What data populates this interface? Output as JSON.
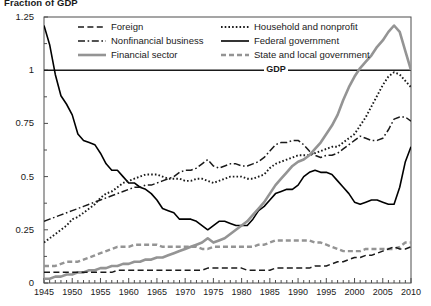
{
  "title": "Fraction of GDP",
  "axes": {
    "y_ticks": [
      "0",
      "0.25",
      "0.5",
      "0.75",
      "1",
      "1.25"
    ],
    "x_ticks": [
      "1945",
      "1950",
      "1955",
      "1960",
      "1965",
      "1970",
      "1975",
      "1980",
      "1985",
      "1990",
      "1995",
      "2000",
      "2005",
      "2010"
    ]
  },
  "gdp_line_label": "GDP",
  "legend": [
    {
      "label": "Foreign",
      "style": "dashed",
      "color": "#1a1a1a"
    },
    {
      "label": "Household and nonprofit",
      "style": "dotted",
      "color": "#1a1a1a"
    },
    {
      "label": "Nonfinancial business",
      "style": "dashdot",
      "color": "#1a1a1a"
    },
    {
      "label": "Federal government",
      "style": "solid",
      "color": "#000000"
    },
    {
      "label": "Financial sector",
      "style": "solid-gray",
      "color": "#949494"
    },
    {
      "label": "State and local government",
      "style": "dashed-gray",
      "color": "#949494"
    }
  ],
  "chart_data": {
    "type": "line",
    "title": "Fraction of GDP",
    "xlabel": "",
    "ylabel": "Fraction of GDP",
    "xlim": [
      1945,
      2010
    ],
    "ylim": [
      0,
      1.25
    ],
    "grid": false,
    "legend_position": "top-inside",
    "annotations": [
      {
        "text": "GDP",
        "y": 1.0,
        "type": "reference-line"
      }
    ],
    "x": [
      1945,
      1946,
      1947,
      1948,
      1949,
      1950,
      1951,
      1952,
      1953,
      1954,
      1955,
      1956,
      1957,
      1958,
      1959,
      1960,
      1961,
      1962,
      1963,
      1964,
      1965,
      1966,
      1967,
      1968,
      1969,
      1970,
      1971,
      1972,
      1973,
      1974,
      1975,
      1976,
      1977,
      1978,
      1979,
      1980,
      1981,
      1982,
      1983,
      1984,
      1985,
      1986,
      1987,
      1988,
      1989,
      1990,
      1991,
      1992,
      1993,
      1994,
      1995,
      1996,
      1997,
      1998,
      1999,
      2000,
      2001,
      2002,
      2003,
      2004,
      2005,
      2006,
      2007,
      2008,
      2009,
      2010
    ],
    "series": [
      {
        "name": "Federal government",
        "style": "solid",
        "color": "#000000",
        "values": [
          1.21,
          1.12,
          0.98,
          0.88,
          0.84,
          0.79,
          0.7,
          0.67,
          0.66,
          0.65,
          0.61,
          0.56,
          0.53,
          0.53,
          0.5,
          0.47,
          0.47,
          0.45,
          0.44,
          0.42,
          0.39,
          0.35,
          0.34,
          0.33,
          0.3,
          0.3,
          0.3,
          0.29,
          0.27,
          0.25,
          0.27,
          0.29,
          0.29,
          0.28,
          0.27,
          0.27,
          0.27,
          0.3,
          0.34,
          0.36,
          0.39,
          0.42,
          0.43,
          0.44,
          0.44,
          0.46,
          0.5,
          0.52,
          0.53,
          0.52,
          0.52,
          0.51,
          0.48,
          0.45,
          0.42,
          0.38,
          0.37,
          0.38,
          0.39,
          0.39,
          0.38,
          0.37,
          0.37,
          0.45,
          0.57,
          0.64
        ]
      },
      {
        "name": "Household and nonprofit",
        "style": "dotted",
        "color": "#1a1a1a",
        "values": [
          0.19,
          0.21,
          0.23,
          0.25,
          0.27,
          0.3,
          0.31,
          0.33,
          0.35,
          0.37,
          0.4,
          0.42,
          0.43,
          0.45,
          0.47,
          0.48,
          0.49,
          0.5,
          0.51,
          0.51,
          0.51,
          0.5,
          0.49,
          0.49,
          0.49,
          0.48,
          0.48,
          0.49,
          0.49,
          0.48,
          0.47,
          0.48,
          0.49,
          0.5,
          0.5,
          0.5,
          0.49,
          0.49,
          0.5,
          0.51,
          0.54,
          0.56,
          0.57,
          0.58,
          0.59,
          0.6,
          0.6,
          0.6,
          0.61,
          0.62,
          0.63,
          0.64,
          0.64,
          0.66,
          0.68,
          0.7,
          0.74,
          0.78,
          0.83,
          0.88,
          0.93,
          0.97,
          0.99,
          0.98,
          0.95,
          0.92
        ]
      },
      {
        "name": "Nonfinancial business",
        "style": "dashdot",
        "color": "#1a1a1a",
        "values": [
          0.29,
          0.3,
          0.31,
          0.32,
          0.33,
          0.34,
          0.35,
          0.36,
          0.37,
          0.38,
          0.39,
          0.4,
          0.41,
          0.42,
          0.43,
          0.44,
          0.45,
          0.45,
          0.46,
          0.46,
          0.47,
          0.48,
          0.49,
          0.5,
          0.52,
          0.53,
          0.53,
          0.54,
          0.56,
          0.58,
          0.55,
          0.54,
          0.55,
          0.56,
          0.56,
          0.55,
          0.55,
          0.56,
          0.57,
          0.59,
          0.62,
          0.65,
          0.66,
          0.66,
          0.67,
          0.67,
          0.65,
          0.62,
          0.6,
          0.59,
          0.6,
          0.6,
          0.61,
          0.63,
          0.65,
          0.67,
          0.69,
          0.68,
          0.67,
          0.67,
          0.68,
          0.72,
          0.77,
          0.78,
          0.78,
          0.76
        ]
      },
      {
        "name": "Financial sector",
        "style": "solid-gray",
        "color": "#949494",
        "values": [
          0.02,
          0.02,
          0.03,
          0.03,
          0.04,
          0.04,
          0.05,
          0.05,
          0.06,
          0.06,
          0.07,
          0.07,
          0.08,
          0.08,
          0.09,
          0.09,
          0.1,
          0.1,
          0.11,
          0.11,
          0.12,
          0.12,
          0.13,
          0.14,
          0.15,
          0.16,
          0.17,
          0.18,
          0.19,
          0.21,
          0.19,
          0.2,
          0.21,
          0.23,
          0.25,
          0.27,
          0.29,
          0.32,
          0.35,
          0.38,
          0.42,
          0.46,
          0.49,
          0.52,
          0.55,
          0.57,
          0.58,
          0.6,
          0.63,
          0.66,
          0.7,
          0.74,
          0.79,
          0.86,
          0.92,
          0.97,
          1.01,
          1.04,
          1.07,
          1.11,
          1.14,
          1.18,
          1.21,
          1.18,
          1.09,
          1.0
        ]
      },
      {
        "name": "State and local government",
        "style": "dashed-gray",
        "color": "#949494",
        "values": [
          0.08,
          0.08,
          0.08,
          0.09,
          0.1,
          0.1,
          0.1,
          0.11,
          0.12,
          0.13,
          0.14,
          0.15,
          0.16,
          0.17,
          0.17,
          0.17,
          0.18,
          0.18,
          0.18,
          0.18,
          0.18,
          0.17,
          0.17,
          0.17,
          0.17,
          0.17,
          0.17,
          0.17,
          0.16,
          0.16,
          0.17,
          0.17,
          0.17,
          0.17,
          0.17,
          0.17,
          0.17,
          0.17,
          0.18,
          0.18,
          0.19,
          0.2,
          0.2,
          0.2,
          0.2,
          0.2,
          0.2,
          0.2,
          0.19,
          0.19,
          0.18,
          0.17,
          0.16,
          0.15,
          0.15,
          0.15,
          0.15,
          0.16,
          0.16,
          0.16,
          0.16,
          0.16,
          0.16,
          0.17,
          0.19,
          0.19
        ]
      },
      {
        "name": "Foreign",
        "style": "dashed",
        "color": "#1a1a1a",
        "values": [
          0.05,
          0.05,
          0.05,
          0.05,
          0.05,
          0.05,
          0.05,
          0.05,
          0.05,
          0.05,
          0.05,
          0.05,
          0.05,
          0.06,
          0.06,
          0.06,
          0.06,
          0.06,
          0.06,
          0.06,
          0.06,
          0.06,
          0.06,
          0.06,
          0.06,
          0.06,
          0.06,
          0.06,
          0.06,
          0.07,
          0.07,
          0.07,
          0.07,
          0.07,
          0.07,
          0.07,
          0.06,
          0.06,
          0.06,
          0.06,
          0.06,
          0.07,
          0.07,
          0.07,
          0.07,
          0.07,
          0.07,
          0.07,
          0.08,
          0.08,
          0.08,
          0.09,
          0.1,
          0.1,
          0.11,
          0.12,
          0.12,
          0.13,
          0.13,
          0.14,
          0.15,
          0.16,
          0.17,
          0.16,
          0.16,
          0.17
        ]
      }
    ]
  }
}
